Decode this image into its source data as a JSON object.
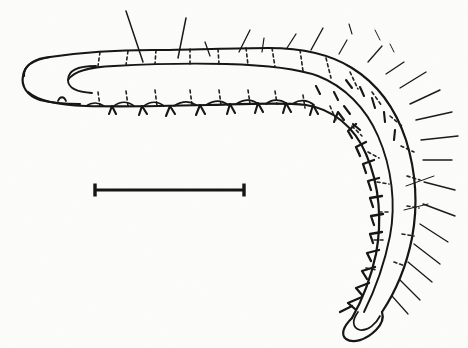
{
  "figure": {
    "orientation": "head-at-left, body curving down to posterior at lower-right",
    "style": "black ink line drawing on white paper, scanned halftone",
    "caption": "",
    "background_color": "#fcfcfb",
    "ink_color": "#151515"
  },
  "scale_bar": {
    "label": "",
    "x_start": 94,
    "x_end": 245,
    "y": 190,
    "length_px": 151,
    "cap_height_px": 13,
    "line_width_px": 3,
    "color": "#151515"
  },
  "anatomy": {
    "head": {
      "name": "head-capsule",
      "position_px": [
        30,
        78
      ],
      "description": "blunt rounded anterior capsule at far left"
    },
    "thorax": {
      "name": "thoracic-segments",
      "description": "anterior segments along the upper horizontal run"
    },
    "abdomen": {
      "name": "abdominal-segments",
      "description": "segments continuing around the bend and down the right side"
    },
    "anal_end": {
      "name": "posterior-tip",
      "position_px": [
        372,
        330
      ],
      "description": "rounded posterior tip at lower right"
    },
    "segment_count": 13,
    "setae_count": 34,
    "spine_count": 40
  },
  "body_outline": {
    "dorsal_path": "M 22 78 C 22 66 34 58 52 55 C 110 47 210 42 280 45 C 330 48 368 62 392 92 C 416 122 424 166 418 208 C 412 250 398 286 384 308",
    "lateral_path": "M 62 82 C 70 70 92 66 120 64 C 190 60 258 60 300 66 C 340 73 372 95 390 130 C 408 166 410 212 402 250 C 396 282 386 302 378 316",
    "ventral_path": "M 32 98 C 46 104 76 106 120 105 C 195 103 268 100 306 104 C 344 110 372 132 384 168 C 396 206 394 250 384 284 C 378 306 370 320 362 328"
  },
  "colors": {
    "ink": "#151515",
    "paper": "#fcfcfb",
    "dashed_segment_line": "#222222",
    "seta": "#1a1a1a"
  }
}
